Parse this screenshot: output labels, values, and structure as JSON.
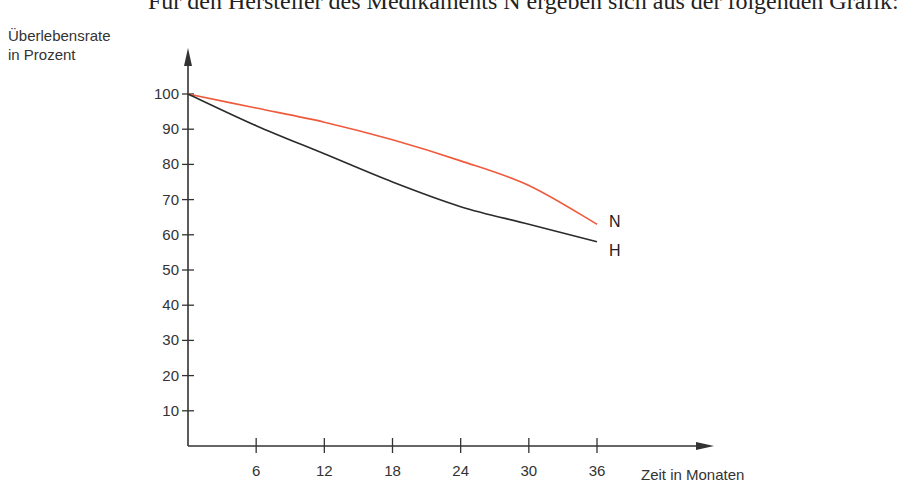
{
  "header_text": "Für den Hersteller des Medikaments N ergeben sich aus der folgenden Grafik:",
  "chart_data": {
    "type": "line",
    "title": "",
    "xlabel": "Zeit in Monaten",
    "ylabel": "Überlebensrate in Prozent",
    "ylabel_lines": [
      "Überlebensrate",
      "in Prozent"
    ],
    "x": [
      0,
      6,
      12,
      18,
      24,
      30,
      36
    ],
    "x_ticks": [
      "6",
      "12",
      "18",
      "24",
      "30",
      "36"
    ],
    "y_ticks": [
      "10",
      "20",
      "30",
      "40",
      "50",
      "60",
      "70",
      "80",
      "90",
      "100"
    ],
    "xlim": [
      0,
      40
    ],
    "ylim": [
      0,
      100
    ],
    "grid": false,
    "legend": "inline labels at line ends",
    "series": [
      {
        "name": "N",
        "color": "#f05a3c",
        "values": [
          100,
          96,
          92,
          87,
          81,
          74,
          63
        ]
      },
      {
        "name": "H",
        "color": "#2b2b2b",
        "values": [
          100,
          91,
          83,
          75,
          68,
          63,
          58
        ]
      }
    ]
  }
}
